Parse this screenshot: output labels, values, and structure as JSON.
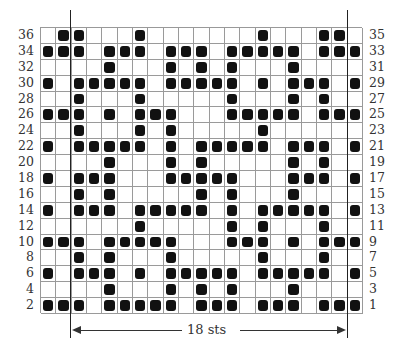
{
  "chart": {
    "columns": 21,
    "rows": 18,
    "left_row_labels": [
      "36",
      "34",
      "32",
      "30",
      "28",
      "26",
      "24",
      "22",
      "20",
      "18",
      "16",
      "14",
      "12",
      "10",
      "8",
      "6",
      "4",
      "2"
    ],
    "right_row_labels": [
      "35",
      "33",
      "31",
      "29",
      "27",
      "25",
      "23",
      "21",
      "19",
      "17",
      "15",
      "13",
      "11",
      "9",
      "7",
      "5",
      "3",
      "1"
    ],
    "filled_cells": [
      [
        2,
        3,
        7,
        15,
        19,
        20
      ],
      [
        1,
        2,
        3,
        5,
        6,
        7,
        9,
        10,
        11,
        13,
        14,
        15,
        16,
        17,
        19,
        20,
        21
      ],
      [
        5,
        9,
        11,
        13,
        17
      ],
      [
        1,
        3,
        4,
        5,
        6,
        7,
        9,
        10,
        11,
        12,
        13,
        15,
        17,
        18,
        19,
        21
      ],
      [
        3,
        7,
        13,
        17,
        19
      ],
      [
        1,
        2,
        3,
        5,
        7,
        8,
        9,
        13,
        14,
        15,
        16,
        17,
        19,
        20,
        21
      ],
      [
        3,
        7,
        9,
        15
      ],
      [
        1,
        3,
        4,
        5,
        6,
        7,
        9,
        11,
        12,
        13,
        14,
        15,
        17,
        18,
        19,
        21
      ],
      [
        5,
        9,
        11,
        17,
        19
      ],
      [
        1,
        3,
        4,
        5,
        9,
        10,
        11,
        12,
        13,
        17,
        18,
        19,
        21
      ],
      [
        3,
        5,
        11,
        13,
        17
      ],
      [
        1,
        3,
        4,
        5,
        7,
        8,
        9,
        10,
        11,
        13,
        15,
        16,
        17,
        18,
        19,
        21
      ],
      [
        7,
        13,
        15,
        19
      ],
      [
        1,
        2,
        3,
        5,
        6,
        7,
        8,
        9,
        13,
        14,
        15,
        17,
        19,
        20,
        21
      ],
      [
        3,
        5,
        9,
        15,
        19
      ],
      [
        1,
        3,
        4,
        5,
        7,
        9,
        10,
        11,
        12,
        13,
        15,
        16,
        17,
        18,
        19,
        21
      ],
      [
        5,
        9,
        11,
        13,
        17
      ],
      [
        1,
        2,
        3,
        5,
        6,
        7,
        8,
        9,
        11,
        12,
        13,
        15,
        16,
        17,
        19,
        20,
        21
      ]
    ],
    "repeat": {
      "label": "18 sts",
      "start_column": 3,
      "end_column": 20
    },
    "colors": {
      "filled": "#111111",
      "empty": "#ffffff",
      "gridline": "#9a9a9a"
    }
  }
}
